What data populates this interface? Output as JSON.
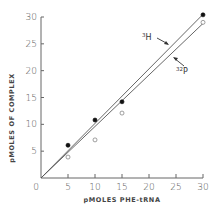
{
  "chart_data": {
    "type": "scatter",
    "title": "",
    "xlabel": "pMOLES PHE-tRNA",
    "ylabel": "pMOLES OF COMPLEX",
    "xlim": [
      0,
      30
    ],
    "ylim": [
      0,
      30
    ],
    "x_ticks": [
      "0",
      "5",
      "10",
      "15",
      "20",
      "25",
      "30"
    ],
    "y_ticks": [
      "5",
      "10",
      "15",
      "20",
      "25",
      "30"
    ],
    "grid": false,
    "legend": "inline annotations with arrows",
    "series": [
      {
        "name": "3H",
        "marker": "filled-circle",
        "x": [
          5,
          10,
          15,
          30
        ],
        "y": [
          6.1,
          10.8,
          14.2,
          30.4
        ],
        "fit_line": {
          "x": [
            0,
            30
          ],
          "y": [
            0,
            30.5
          ]
        }
      },
      {
        "name": "32P",
        "marker": "open-circle",
        "x": [
          5,
          10,
          15,
          30
        ],
        "y": [
          3.9,
          7.1,
          12.1,
          29.0
        ],
        "fit_line": {
          "x": [
            0,
            30
          ],
          "y": [
            0,
            28.8
          ]
        }
      }
    ],
    "annotations": [
      {
        "text_sup": "3",
        "text": "H",
        "target_series": "3H"
      },
      {
        "text_sup": "32",
        "text": "P",
        "target_series": "32P"
      }
    ]
  }
}
